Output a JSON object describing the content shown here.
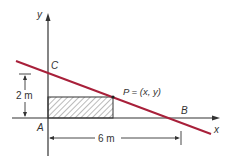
{
  "diagram": {
    "type": "geometry",
    "colors": {
      "line": "#a8203a",
      "axes": "#333333",
      "hatch": "#444444",
      "background": "#ffffff"
    },
    "axes": {
      "x_label": "x",
      "y_label": "y"
    },
    "points": {
      "origin_label": "A",
      "y_intercept_label": "C",
      "x_intercept_label": "B",
      "vertex_label": "P = (x, y)"
    },
    "dimensions": {
      "height_label": "2 m",
      "width_label": "6 m"
    }
  }
}
